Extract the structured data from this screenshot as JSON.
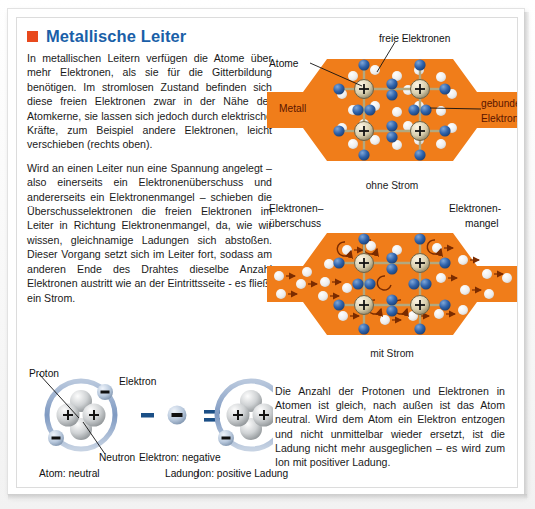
{
  "page": {
    "title": "Metallische Leiter",
    "bullet_color": "#e8491d",
    "title_color": "#1a5fa8"
  },
  "body_paragraphs": [
    "In metallischen Leitern verfügen die Atome über mehr Elektronen, als sie für die Gitterbildung benötigen. Im stromlosen Zustand befinden sich diese freien Elektronen zwar in der Nähe der Atomkerne, sie lassen sich jedoch durch elektrische Kräfte, zum Beispiel andere Elektronen, leicht verschieben (rechts oben).",
    "Wird an einen Leiter nun eine Spannung angelegt – also einerseits ein Elektronenüberschuss und andererseits ein Elektronenmangel – schieben die Überschusselektronen die freien Elektronen im Leiter in Richtung Elektronenmangel, da, wie wir wissen, gleichnamige Ladungen sich abstoßen. Dieser Vorgang setzt sich im Leiter fort, sodass am anderen Ende des Drahtes dieselbe Anzahl Elektronen austritt wie an der Eintrittsseite - es fließt ein Strom."
  ],
  "diagram_no_current": {
    "caption": "ohne Strom",
    "labels": {
      "atoms": "Atome",
      "free_electrons": "freie Elektronen",
      "metal": "Metall",
      "bound_electrons_line1": "gebundene",
      "bound_electrons_line2": "Elektronen"
    },
    "metal_color": "#f07d1a",
    "free_electron_color": "#efefef",
    "bound_electron_color": "#2a5fa8",
    "nuclei_count": 4
  },
  "diagram_with_current": {
    "caption": "mit Strom",
    "labels": {
      "surplus_line1": "Elektronen–",
      "surplus_line2": "überschuss",
      "deficit_line1": "Elektronen-",
      "deficit_line2": "mangel"
    },
    "metal_color": "#f07d1a",
    "arrow_color": "#7a2b00",
    "nuclei_count": 4
  },
  "atom_figures": {
    "proton_label": "Proton",
    "electron_label": "Elektron",
    "neutron_label": "Neutron",
    "atom_caption": "Atom: neutral",
    "electron_caption_line1": "Elektron: negative",
    "electron_caption_line2": "Ladung",
    "ion_caption": "Ion: positive Ladung",
    "minus_sign": "−",
    "equals_sign": "=",
    "proton_glyph": "+",
    "electron_glyph": "−",
    "atom_proton_count": 2,
    "atom_neutron_count": 2,
    "atom_electron_count": 2,
    "ion_electron_count": 1,
    "orbit_color": "#8fa9cc"
  },
  "bottom_text": "Die Anzahl der Protonen und Elektronen in Atomen ist gleich, nach außen ist das Atom neutral. Wird dem Atom ein Elektron entzogen und nicht unmittelbar wieder ersetzt, ist die Ladung nicht mehr ausgeglichen – es wird zum Ion mit positiver Ladung."
}
